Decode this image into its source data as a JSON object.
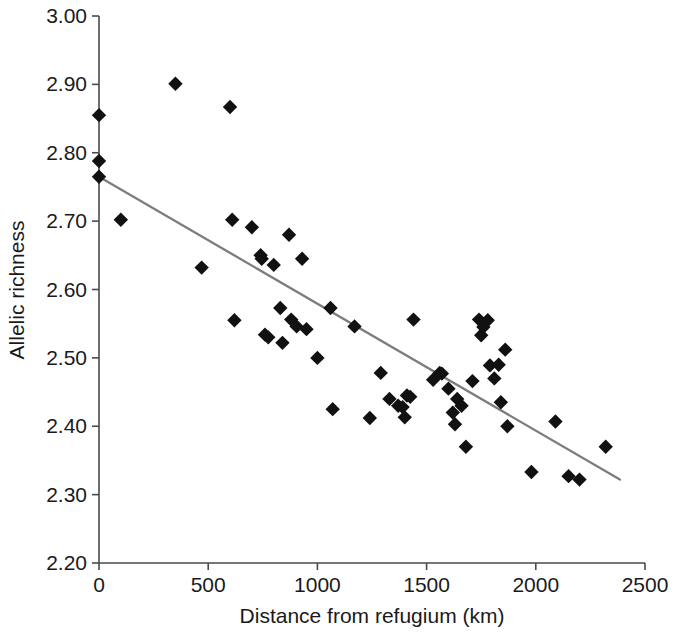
{
  "chart_data": {
    "type": "scatter",
    "title": "",
    "xlabel": "Distance from refugium (km)",
    "ylabel": "Allelic richness",
    "xlim": [
      0,
      2500
    ],
    "ylim": [
      2.2,
      3.0
    ],
    "xticks": [
      0,
      500,
      1000,
      1500,
      2000,
      2500
    ],
    "xtick_labels": [
      "0",
      "500",
      "1000",
      "1500",
      "2000",
      "2500"
    ],
    "yticks": [
      2.2,
      2.3,
      2.4,
      2.5,
      2.6,
      2.7,
      2.8,
      2.9,
      3.0
    ],
    "ytick_labels": [
      "2.20",
      "2.30",
      "2.40",
      "2.50",
      "2.60",
      "2.70",
      "2.80",
      "2.90",
      "3.00"
    ],
    "grid": false,
    "legend": null,
    "marker_shape": "diamond",
    "marker_color": "#111111",
    "series": [
      {
        "name": "Populations",
        "points": [
          [
            0,
            2.855
          ],
          [
            0,
            2.788
          ],
          [
            0,
            2.765
          ],
          [
            100,
            2.702
          ],
          [
            350,
            2.901
          ],
          [
            470,
            2.632
          ],
          [
            600,
            2.867
          ],
          [
            610,
            2.702
          ],
          [
            620,
            2.555
          ],
          [
            700,
            2.691
          ],
          [
            740,
            2.65
          ],
          [
            745,
            2.645
          ],
          [
            760,
            2.534
          ],
          [
            775,
            2.53
          ],
          [
            800,
            2.636
          ],
          [
            830,
            2.573
          ],
          [
            840,
            2.522
          ],
          [
            870,
            2.68
          ],
          [
            880,
            2.556
          ],
          [
            905,
            2.546
          ],
          [
            930,
            2.645
          ],
          [
            950,
            2.542
          ],
          [
            1000,
            2.5
          ],
          [
            1060,
            2.573
          ],
          [
            1070,
            2.425
          ],
          [
            1170,
            2.546
          ],
          [
            1240,
            2.412
          ],
          [
            1290,
            2.478
          ],
          [
            1330,
            2.44
          ],
          [
            1370,
            2.43
          ],
          [
            1390,
            2.428
          ],
          [
            1400,
            2.413
          ],
          [
            1410,
            2.445
          ],
          [
            1425,
            2.443
          ],
          [
            1440,
            2.556
          ],
          [
            1530,
            2.468
          ],
          [
            1560,
            2.478
          ],
          [
            1570,
            2.477
          ],
          [
            1600,
            2.455
          ],
          [
            1620,
            2.42
          ],
          [
            1630,
            2.403
          ],
          [
            1640,
            2.44
          ],
          [
            1660,
            2.43
          ],
          [
            1680,
            2.37
          ],
          [
            1710,
            2.466
          ],
          [
            1740,
            2.556
          ],
          [
            1750,
            2.533
          ],
          [
            1760,
            2.545
          ],
          [
            1780,
            2.555
          ],
          [
            1790,
            2.489
          ],
          [
            1810,
            2.47
          ],
          [
            1830,
            2.49
          ],
          [
            1840,
            2.435
          ],
          [
            1860,
            2.512
          ],
          [
            1870,
            2.4
          ],
          [
            1980,
            2.333
          ],
          [
            2090,
            2.407
          ],
          [
            2150,
            2.327
          ],
          [
            2200,
            2.322
          ],
          [
            2320,
            2.37
          ]
        ]
      }
    ],
    "trend_line": {
      "name": "linear fit",
      "color": "#7d7d7d",
      "x_start": 0,
      "y_start": 2.765,
      "x_end": 2385,
      "y_end": 2.322
    }
  },
  "axes": {
    "x_axis_name": "x-axis",
    "y_axis_name": "y-axis"
  }
}
